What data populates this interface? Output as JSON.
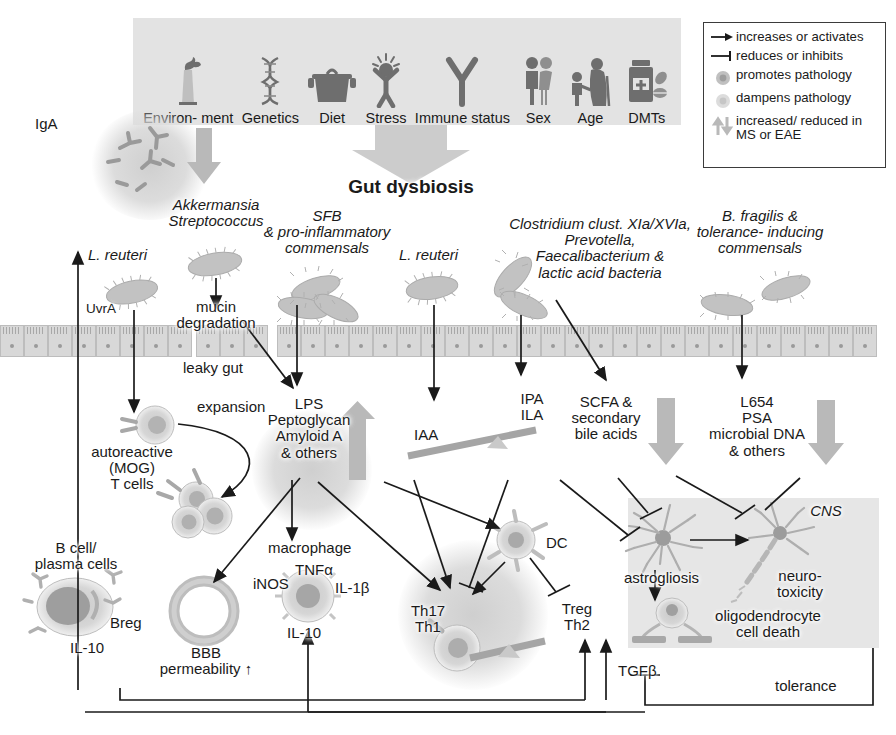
{
  "figure": {
    "center_heading": "Gut dysbiosis"
  },
  "factors": {
    "panel_name": "risk-factor-panel",
    "items": [
      {
        "label": "Environ-\nment",
        "icon": "factory-icon"
      },
      {
        "label": "Genetics",
        "icon": "dna-helix-icon"
      },
      {
        "label": "Diet",
        "icon": "cooking-pot-icon"
      },
      {
        "label": "Stress",
        "icon": "stressed-person-icon"
      },
      {
        "label": "Immune\nstatus",
        "icon": "antibody-icon"
      },
      {
        "label": "Sex",
        "icon": "male-female-icon"
      },
      {
        "label": "Age",
        "icon": "child-and-elder-icon"
      },
      {
        "label": "DMTs",
        "icon": "pill-bottle-icon"
      }
    ]
  },
  "legend": {
    "items": [
      {
        "icon": "arrow-head-icon",
        "text": "increases or activates"
      },
      {
        "icon": "inhibit-bar-icon",
        "text": "reduces or inhibits"
      },
      {
        "icon": "dark-cell-icon",
        "text": "promotes pathology"
      },
      {
        "icon": "light-cell-icon",
        "text": "dampens pathology"
      },
      {
        "icon": "up-down-arrows-icon",
        "text": "increased/ reduced\nin MS or EAE"
      }
    ]
  },
  "microbes": {
    "iga": "IgA",
    "l_reuteri_left": "L. reuteri",
    "uvra": "UvrA",
    "akkermansia": "Akkermansia\nStreptococcus",
    "mucin_degradation": "mucin\ndegradation",
    "leaky_gut": "leaky gut",
    "sfb": "SFB\n& pro-inflammatory\ncommensals",
    "l_reuteri_mid": "L. reuteri",
    "clostridium": "Clostridium clust. XIa/XVIa,\nPrevotella,\nFaecalibacterium &\nlactic acid bacteria",
    "b_fragilis": "B. fragilis &\ntolerance- inducing\ncommensals"
  },
  "metabolites": {
    "lps": "LPS\nPeptoglycan\nAmyloid A\n& others",
    "iaa": "IAA",
    "ipa_ila": "IPA\nILA",
    "scfa": "SCFA &\nsecondary\nbile acids",
    "l654": "L654\nPSA\nmicrobial DNA\n& others"
  },
  "immune": {
    "expansion": "expansion",
    "autoreactive": "autoreactive\n(MOG)\nT cells",
    "b_cells": "B cell/\nplasma cells",
    "breg": "Breg",
    "il10_b": "IL-10",
    "bbb": "BBB\npermeability ↑",
    "macrophage": "macrophage",
    "inos": "iNOS",
    "tnfa": "TNFα",
    "il1b": "IL-1β",
    "il10_mac": "IL-10",
    "th17_th1": "Th17\nTh1",
    "dc": "DC",
    "treg_th2": "Treg\nTh2",
    "tgfb": "TGFβ",
    "tolerance": "tolerance"
  },
  "cns": {
    "label": "CNS",
    "astrogliosis": "astrogliosis",
    "neurotoxicity": "neuro-\ntoxicity",
    "oligodendrocyte": "oligodendrocyte\ncell death"
  },
  "colors": {
    "panel_gray": "#e3e3e3",
    "cns_gray": "#e6e6e6",
    "arrow_gray": "#b9b9b9",
    "cell_gray": "#c2c2c2",
    "ink": "#1a1a1a",
    "background": "#ffffff"
  }
}
